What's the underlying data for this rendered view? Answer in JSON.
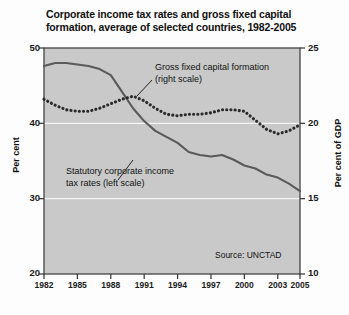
{
  "title": "Corporate income tax rates and gross fixed capital formation, average of selected countries, 1982-2005",
  "axes": {
    "left_title": "Per cent",
    "right_title": "Per cent of GDP",
    "left_ticks": [
      "50",
      "40",
      "30",
      "20"
    ],
    "right_ticks": [
      "25",
      "20",
      "15",
      "10"
    ],
    "x_ticks": [
      "1982",
      "1985",
      "1988",
      "1991",
      "1994",
      "1997",
      "2000",
      "2003",
      "2005"
    ]
  },
  "annotations": {
    "gfcf": "Gross fixed capital formation (right scale)",
    "tax": "Statutory corporate income tax rates (left scale)",
    "source": "Source: UNCTAD"
  },
  "colors": {
    "plot_background": "#c9c9c9",
    "line": "#5a5a5a",
    "dotted": "#2b2b2b",
    "gridline": "#f4f4f4",
    "axis": "#333333",
    "text": "#111111"
  },
  "chart_data": {
    "type": "line",
    "title": "Corporate income tax rates and gross fixed capital formation, average of selected countries, 1982-2005",
    "xlabel": "",
    "ylabel": "Per cent",
    "y2label": "Per cent of GDP",
    "ylim": [
      20,
      50
    ],
    "y2lim": [
      10,
      25
    ],
    "xlim": [
      1982,
      2005
    ],
    "grid": true,
    "legend_position": "inline-annotations",
    "x": [
      1982,
      1983,
      1984,
      1985,
      1986,
      1987,
      1988,
      1989,
      1990,
      1991,
      1992,
      1993,
      1994,
      1995,
      1996,
      1997,
      1998,
      1999,
      2000,
      2001,
      2002,
      2003,
      2004,
      2005
    ],
    "series": [
      {
        "name": "Statutory corporate income tax rates (left scale)",
        "axis": "left",
        "style": "solid",
        "unit": "per cent",
        "values": [
          47.6,
          48.0,
          48.0,
          47.8,
          47.6,
          47.2,
          46.4,
          44.2,
          42.0,
          40.3,
          39.0,
          38.2,
          37.4,
          36.2,
          35.8,
          35.6,
          35.8,
          35.2,
          34.4,
          34.0,
          33.2,
          32.8,
          32.0,
          31.0
        ]
      },
      {
        "name": "Gross fixed capital formation (right scale)",
        "axis": "right",
        "style": "dotted",
        "unit": "per cent of GDP",
        "values": [
          21.6,
          21.2,
          20.9,
          20.8,
          20.8,
          21.0,
          21.3,
          21.6,
          21.8,
          21.5,
          21.0,
          20.6,
          20.5,
          20.6,
          20.6,
          20.7,
          20.9,
          20.9,
          20.8,
          20.2,
          19.6,
          19.3,
          19.5,
          19.9
        ]
      }
    ]
  }
}
